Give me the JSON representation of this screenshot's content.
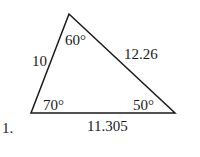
{
  "problem": {
    "number": "1."
  },
  "triangle": {
    "vertices": {
      "top": [
        69,
        14
      ],
      "bottom_left": [
        31,
        113
      ],
      "bottom_right": [
        175,
        113
      ]
    },
    "angles": {
      "top": "60°",
      "bottom_left": "70°",
      "bottom_right": "50°"
    },
    "sides": {
      "left": "10",
      "right": "12.26",
      "bottom": "11.305"
    },
    "stroke_color": "#1a1a1a"
  }
}
